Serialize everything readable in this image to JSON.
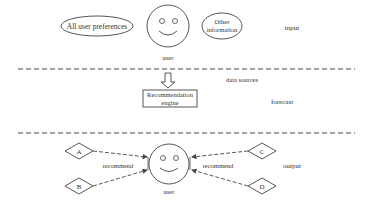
{
  "input_section": {
    "label": "input",
    "preferences_ellipse": "All user preferences",
    "other_info_line1": "Other",
    "other_info_line2": "information",
    "user_label": "user"
  },
  "divider1_label": "data sources",
  "forecast_section": {
    "label": "forecast",
    "engine_line1": "Recommendation",
    "engine_line2": "engine"
  },
  "output_section": {
    "label": "output",
    "user_label": "user",
    "left_recommend": "recommend",
    "right_recommend": "recommend",
    "items": [
      "A",
      "B",
      "C",
      "D"
    ]
  },
  "colors": {
    "stroke": "#444444",
    "text": "#333333",
    "background": "#ffffff"
  }
}
